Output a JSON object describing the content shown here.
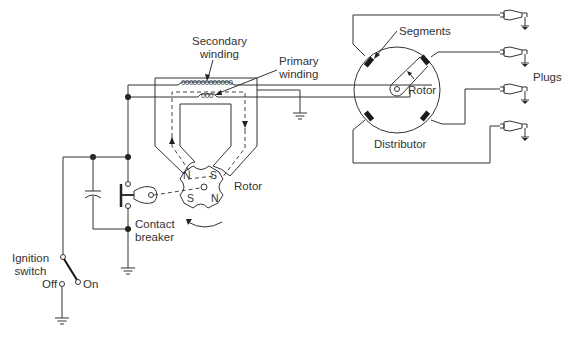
{
  "diagram": {
    "type": "ignition-system-schematic",
    "labels": {
      "secondary_winding": [
        "Secondary",
        "winding"
      ],
      "primary_winding": [
        "Primary",
        "winding"
      ],
      "rotor_magneto": "Rotor",
      "contact_breaker": [
        "Contact",
        "breaker"
      ],
      "ignition_switch": [
        "Ignition",
        "switch"
      ],
      "switch_off": "Off",
      "switch_on": "On",
      "segments": "Segments",
      "rotor_distributor": "Rotor",
      "distributor": "Distributor",
      "plugs": "Plugs"
    },
    "pole_labels": {
      "top_left": "N",
      "top_right": "S",
      "bottom_left": "S",
      "bottom_right": "N"
    },
    "secondary_coil_turns": "0000000000000",
    "primary_coil_turns": "000",
    "plug_count": 4,
    "segment_count": 4,
    "colors": {
      "line": "#333333",
      "background": "#ffffff"
    }
  }
}
